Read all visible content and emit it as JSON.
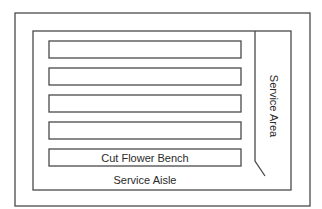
{
  "diagram": {
    "type": "greenhouse-floor-plan",
    "outer_wall": {
      "x": 15,
      "y": 13,
      "w": 295,
      "h": 193
    },
    "inner_area": {
      "x": 33,
      "y": 31,
      "w": 258,
      "h": 159
    },
    "benches": [
      {
        "label": "",
        "x": 49,
        "y": 41,
        "w": 192,
        "h": 17
      },
      {
        "label": "",
        "x": 49,
        "y": 68,
        "w": 192,
        "h": 17
      },
      {
        "label": "",
        "x": 49,
        "y": 95,
        "w": 192,
        "h": 17
      },
      {
        "label": "",
        "x": 49,
        "y": 122,
        "w": 192,
        "h": 17
      },
      {
        "label": "Cut Flower Bench",
        "x": 49,
        "y": 149,
        "w": 192,
        "h": 17
      }
    ],
    "service_area": {
      "label": "Service Area"
    },
    "service_aisle": {
      "label": "Service Aisle"
    }
  }
}
